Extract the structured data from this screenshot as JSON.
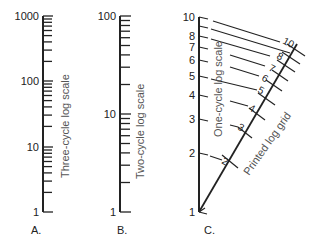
{
  "panels": {
    "a": {
      "letter": "A.",
      "caption": "Three-cycle log scale",
      "tick_labels": {
        "t1": "1",
        "t10": "10",
        "t100": "100",
        "t1000": "1000"
      },
      "cycles": 3
    },
    "b": {
      "letter": "B.",
      "caption": "Two-cycle log scale",
      "tick_labels": {
        "t1": "1",
        "t10": "10",
        "t100": "100"
      },
      "cycles": 2
    },
    "c": {
      "letter": "C.",
      "caption_vertical": "One-cycle log scale",
      "caption_diagonal": "Printed log grid",
      "vertical_labels": {
        "v1": "1",
        "v2": "2",
        "v3": "3",
        "v4": "4",
        "v5": "5",
        "v6": "6",
        "v7": "7",
        "v8": "8",
        "v10": "10"
      },
      "diagonal_labels": {
        "d2": "2",
        "d3": "3",
        "d4": "4",
        "d5": "5",
        "d6": "6",
        "d7": "7",
        "d8": "8",
        "d10": "10"
      }
    }
  },
  "colors": {
    "ink": "#222222",
    "background": "#ffffff"
  }
}
